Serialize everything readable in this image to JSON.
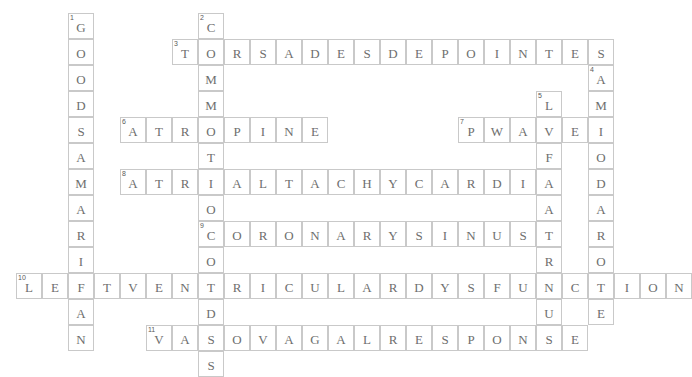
{
  "puzzle": {
    "title": "Cardiology Crossword Grid",
    "grid": {
      "cell_size": 26,
      "origin_x": 16,
      "origin_y": 13,
      "cols": 24,
      "rows": 14
    },
    "colors": {
      "cell_border": "#c9c9c9",
      "letter": "#6e6e6e",
      "number": "#5a5a5a",
      "background": "#ffffff"
    },
    "entries": [
      {
        "number": "1",
        "direction": "down",
        "answer": "GOODSAMARITAN",
        "row": 0,
        "col": 2,
        "length": 13
      },
      {
        "number": "2",
        "direction": "down",
        "answer": "COMMOTIOCORDIS",
        "row": 0,
        "col": 7,
        "length": 14
      },
      {
        "number": "3",
        "direction": "across",
        "answer": "TORSADESDEPOINTES",
        "row": 1,
        "col": 6,
        "length": 17
      },
      {
        "number": "4",
        "direction": "down",
        "answer": "AMIODARONE",
        "row": 2,
        "col": 22,
        "length": 10
      },
      {
        "number": "5",
        "direction": "down",
        "answer": "LEFTATRIUM",
        "row": 3,
        "col": 20,
        "length": 10
      },
      {
        "number": "6",
        "direction": "across",
        "answer": "ATROPINE",
        "row": 4,
        "col": 4,
        "length": 8
      },
      {
        "number": "7",
        "direction": "across",
        "answer": "PWAVE",
        "row": 4,
        "col": 17,
        "length": 5
      },
      {
        "number": "8",
        "direction": "across",
        "answer": "ATRIALTACHYCARDIA",
        "row": 6,
        "col": 4,
        "length": 17
      },
      {
        "number": "9",
        "direction": "across",
        "answer": "CORONARYSINUS",
        "row": 8,
        "col": 7,
        "length": 13
      },
      {
        "number": "10",
        "direction": "across",
        "answer": "LEFTVENTRICULARDYSFUNCTION",
        "row": 10,
        "col": 0,
        "length": 26
      },
      {
        "number": "11",
        "direction": "across",
        "answer": "VASOVAGALRESPONSE",
        "row": 12,
        "col": 5,
        "length": 17
      }
    ]
  }
}
